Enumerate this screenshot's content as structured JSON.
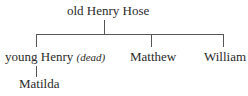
{
  "tree": {
    "root": {
      "label": "old Henry Hose"
    },
    "children": [
      {
        "label": "young Henry",
        "note": "(dead)",
        "children": [
          {
            "label": "Matilda"
          }
        ]
      },
      {
        "label": "Matthew"
      },
      {
        "label": "William"
      }
    ]
  },
  "colors": {
    "text": "#2a2a2a",
    "line": "#555555"
  }
}
